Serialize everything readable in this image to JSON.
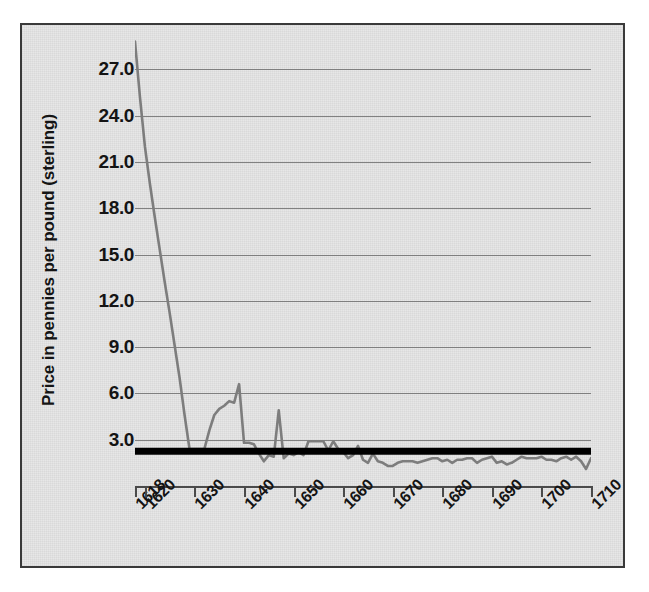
{
  "chart_data": {
    "type": "line",
    "title": "",
    "subtitle": "",
    "xlabel": "",
    "ylabel": "Price in pennies per pound (sterling)",
    "grid": "horizontal",
    "legend": "none",
    "xlim": [
      1618,
      1710
    ],
    "ylim": [
      0.0,
      28.9
    ],
    "yticks": [
      "27.0",
      "24.0",
      "21.0",
      "18.0",
      "15.0",
      "12.0",
      "9.0",
      "6.0",
      "3.0"
    ],
    "ytick_values": [
      27.0,
      24.0,
      21.0,
      18.0,
      15.0,
      12.0,
      9.0,
      6.0,
      3.0
    ],
    "xticks": [
      "1618",
      "1620",
      "1630",
      "1640",
      "1650",
      "1660",
      "1670",
      "1680",
      "1690",
      "1700",
      "1710"
    ],
    "xtick_values": [
      1618,
      1620,
      1630,
      1640,
      1650,
      1660,
      1670,
      1680,
      1690,
      1700,
      1710
    ],
    "series": [
      {
        "name": "Tobacco price",
        "color": "#7d7d7d",
        "x": [
          1618,
          1619,
          1620,
          1621,
          1622,
          1623,
          1624,
          1625,
          1626,
          1627,
          1628,
          1629,
          1630,
          1631,
          1632,
          1633,
          1634,
          1635,
          1636,
          1637,
          1638,
          1639,
          1640,
          1641,
          1642,
          1643,
          1644,
          1645,
          1646,
          1647,
          1648,
          1649,
          1650,
          1651,
          1652,
          1653,
          1654,
          1655,
          1656,
          1657,
          1658,
          1659,
          1660,
          1661,
          1662,
          1663,
          1664,
          1665,
          1666,
          1667,
          1668,
          1669,
          1670,
          1671,
          1672,
          1673,
          1674,
          1675,
          1676,
          1677,
          1678,
          1679,
          1680,
          1681,
          1682,
          1683,
          1684,
          1685,
          1686,
          1687,
          1688,
          1689,
          1690,
          1691,
          1692,
          1693,
          1694,
          1695,
          1696,
          1697,
          1698,
          1699,
          1700,
          1701,
          1702,
          1703,
          1704,
          1705,
          1706,
          1707,
          1708,
          1709,
          1710
        ],
        "y": [
          28.8,
          25.2,
          22.0,
          19.6,
          17.4,
          15.3,
          13.2,
          11.2,
          9.1,
          7.0,
          4.6,
          2.4,
          2.4,
          2.4,
          2.4,
          3.6,
          4.6,
          5.0,
          5.2,
          5.5,
          5.4,
          6.6,
          2.8,
          2.8,
          2.7,
          2.1,
          1.6,
          2.0,
          1.9,
          4.9,
          1.8,
          2.1,
          2.0,
          2.2,
          2.0,
          2.9,
          2.9,
          2.9,
          2.9,
          2.3,
          2.9,
          2.4,
          2.2,
          1.8,
          2.0,
          2.6,
          1.7,
          1.5,
          2.1,
          1.6,
          1.5,
          1.3,
          1.3,
          1.5,
          1.6,
          1.6,
          1.6,
          1.5,
          1.6,
          1.7,
          1.8,
          1.8,
          1.6,
          1.7,
          1.5,
          1.7,
          1.7,
          1.8,
          1.8,
          1.5,
          1.7,
          1.8,
          1.9,
          1.5,
          1.6,
          1.4,
          1.5,
          1.7,
          1.9,
          1.8,
          1.8,
          1.8,
          1.9,
          1.7,
          1.7,
          1.6,
          1.8,
          1.9,
          1.7,
          1.9,
          1.6,
          1.1,
          1.8
        ]
      },
      {
        "name": "Reference level",
        "color": "#000000",
        "style": "thick-horizontal",
        "value": 2.25,
        "x": [
          1618,
          1710
        ],
        "y": [
          2.25,
          2.25
        ]
      }
    ]
  },
  "axes": {
    "ylabel": "Price in pennies per pound (sterling)"
  }
}
